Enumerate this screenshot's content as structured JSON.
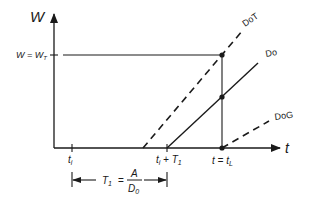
{
  "diagram": {
    "axes": {
      "y_label": "W",
      "x_label": "t",
      "y_level_label": "W = W",
      "y_level_sub": "T"
    },
    "ticks": {
      "ti_main": "t",
      "ti_sub": "i",
      "tiT_main1": "t",
      "tiT_sub1": "i",
      "tiT_plus": " + T",
      "tiT_sub2": "1",
      "tL_main": "t = t",
      "tL_sub": "L"
    },
    "lines": {
      "dot_label": "DoT",
      "do_label": "Do",
      "dog_label": "DoG"
    },
    "dimension": {
      "lhs_main": "T",
      "lhs_sub": "1",
      "equals": "=",
      "numerator": "A",
      "denominator_main": "D",
      "denominator_sub": "0"
    },
    "colors": {
      "ink": "#1a1a1a",
      "background": "#ffffff"
    }
  }
}
